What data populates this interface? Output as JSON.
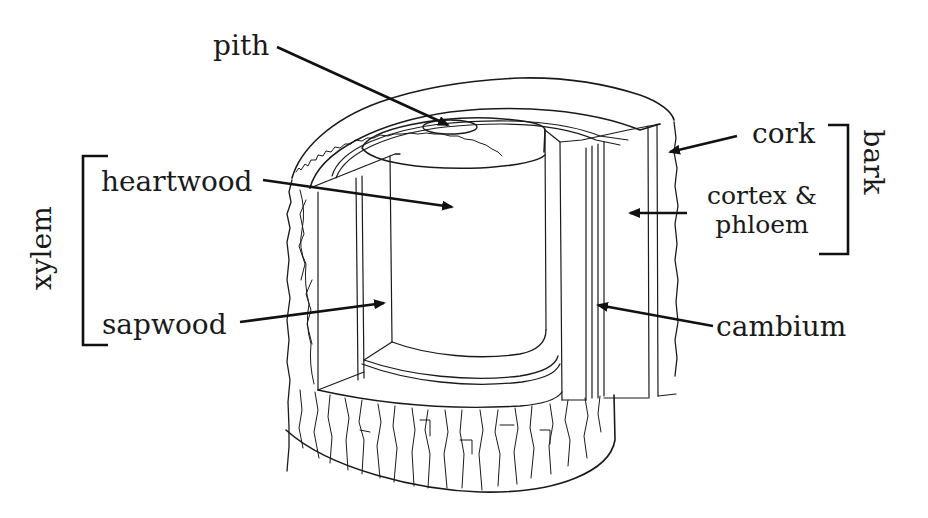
{
  "diagram": {
    "labels": {
      "pith": "pith",
      "heartwood": "heartwood",
      "sapwood": "sapwood",
      "xylem": "xylem",
      "cork": "cork",
      "cortex_phloem_line1": "cortex &",
      "cortex_phloem_line2": "phloem",
      "bark": "bark",
      "cambium": "cambium"
    },
    "groups": [
      {
        "name": "xylem",
        "members": [
          "heartwood",
          "sapwood"
        ],
        "side": "left"
      },
      {
        "name": "bark",
        "members": [
          "cork",
          "cortex & phloem"
        ],
        "side": "right"
      }
    ],
    "colors": {
      "ink": "#1a1a1a",
      "background": "#ffffff"
    }
  }
}
